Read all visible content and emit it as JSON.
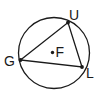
{
  "diagram": {
    "type": "circle-inscribed-triangle",
    "circle": {
      "center_label": "F",
      "cx": 54,
      "cy": 53,
      "r": 35.5
    },
    "points": [
      {
        "label": "U",
        "x": 68,
        "y": 22.5,
        "label_x": 69,
        "label_y": 20
      },
      {
        "label": "G",
        "x": 20.5,
        "y": 60,
        "label_x": 4,
        "label_y": 66
      },
      {
        "label": "L",
        "x": 82,
        "y": 67,
        "label_x": 86,
        "label_y": 78
      },
      {
        "label": "F",
        "x": 52.5,
        "y": 52.5,
        "label_x": 55.5,
        "label_y": 57
      }
    ],
    "segments": [
      [
        "G",
        "U"
      ],
      [
        "U",
        "L"
      ],
      [
        "L",
        "G"
      ]
    ],
    "stroke_color": "#1a1a1a"
  }
}
